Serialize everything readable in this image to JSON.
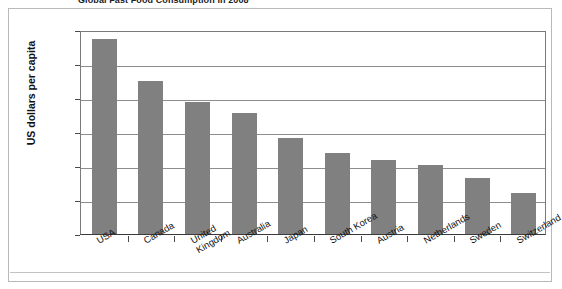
{
  "chart_data": {
    "type": "bar",
    "title": "Global Fast Food Consumption in 2008",
    "xlabel": "",
    "ylabel": "US dollars per capita",
    "categories": [
      "USA",
      "Canada",
      "United Kingdom",
      "Australia",
      "Japan",
      "South Korea",
      "Austria",
      "Netherlands",
      "Sweden",
      "Switzerland"
    ],
    "values": [
      575,
      450,
      388,
      355,
      283,
      237,
      217,
      202,
      165,
      121
    ],
    "ylim": [
      0,
      600
    ],
    "yticks": [
      0,
      100,
      200,
      300,
      400,
      500,
      600
    ],
    "ytick_labels": [
      "0",
      "$100",
      "$200",
      "$300",
      "$400",
      "$500",
      "$600"
    ],
    "grid": true,
    "legend": false,
    "bar_color": "#808080",
    "frame_color": "#b9b9b9",
    "gridline_color": "#8d8d8d"
  },
  "axis": {
    "y_title": "US dollars per capita"
  }
}
